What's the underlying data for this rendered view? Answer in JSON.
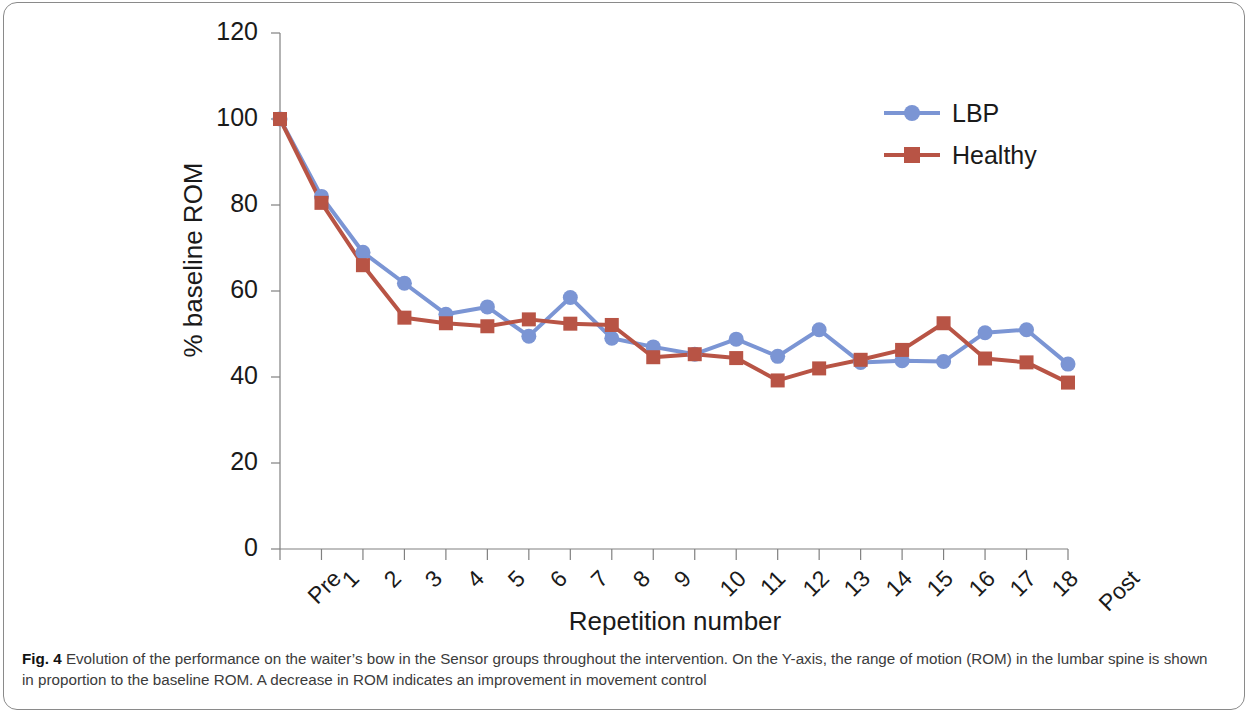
{
  "figure": {
    "caption_prefix": "Fig. 4",
    "caption_text": " Evolution of the performance on the waiter’s bow in the Sensor groups throughout the intervention. On the Y-axis, the range of motion (ROM) in the lumbar spine is shown in proportion to the baseline ROM. A decrease in ROM indicates an improvement in movement control"
  },
  "colors": {
    "lbp": "#7b95d4",
    "healthy": "#b85445",
    "axis": "#808080",
    "text": "#1a1a1a"
  },
  "chart_data": {
    "type": "line",
    "title": "",
    "xlabel": "Repetition number",
    "ylabel": "% baseline ROM",
    "ylim": [
      0,
      120
    ],
    "yticks": [
      0,
      20,
      40,
      60,
      80,
      100,
      120
    ],
    "grid": false,
    "legend_position": "top-right",
    "categories": [
      "Pre",
      "1",
      "2",
      "3",
      "4",
      "5",
      "6",
      "7",
      "8",
      "9",
      "10",
      "11",
      "12",
      "13",
      "14",
      "15",
      "16",
      "17",
      "18",
      "Post"
    ],
    "series": [
      {
        "name": "LBP",
        "color": "#7b95d4",
        "marker": "circle",
        "values": [
          100,
          82,
          69,
          61.8,
          54.6,
          56.3,
          49.5,
          58.5,
          49,
          47,
          45.3,
          48.8,
          44.8,
          51,
          43.4,
          43.8,
          43.6,
          50.3,
          51,
          43
        ]
      },
      {
        "name": "Healthy",
        "color": "#b85445",
        "marker": "square",
        "values": [
          100,
          80.5,
          66,
          53.8,
          52.5,
          51.8,
          53.4,
          52.4,
          52.1,
          44.6,
          45.3,
          44.4,
          39.2,
          42,
          44,
          46.3,
          52.5,
          44.3,
          43.4,
          38.7
        ]
      }
    ]
  },
  "legend": {
    "items": [
      {
        "label": "LBP",
        "color": "#7b95d4",
        "marker": "circle"
      },
      {
        "label": "Healthy",
        "color": "#b85445",
        "marker": "square"
      }
    ]
  }
}
